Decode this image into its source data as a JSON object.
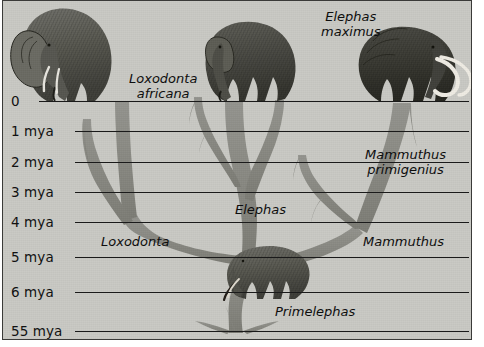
{
  "figure": {
    "kind": "phylogenetic-tree",
    "background_color": "#c9c9c4",
    "ink_color": "#1a1a1a",
    "branch_color": "#8a8a85"
  },
  "axis": {
    "orientation": "vertical-time",
    "unit": "mya",
    "ticks": [
      {
        "label": "0",
        "y": 100
      },
      {
        "label": "1 mya",
        "y": 130
      },
      {
        "label": "2 mya",
        "y": 161
      },
      {
        "label": "3 mya",
        "y": 191
      },
      {
        "label": "4 mya",
        "y": 221
      },
      {
        "label": "5 mya",
        "y": 256
      },
      {
        "label": "6 mya",
        "y": 291
      },
      {
        "label": "55 mya",
        "y": 330
      }
    ]
  },
  "taxa": [
    {
      "id": "loxodonta-africana",
      "label": "Loxodonta\nafricana",
      "rank": "species",
      "x": 126,
      "y": 70,
      "align": "left"
    },
    {
      "id": "elephas-maximus",
      "label": "Elephas\nmaximus",
      "rank": "species",
      "x": 318,
      "y": 8,
      "align": "left"
    },
    {
      "id": "mammuthus-primigenius",
      "label": "Mammuthus\nprimigenius",
      "rank": "species",
      "x": 362,
      "y": 146,
      "align": "left"
    },
    {
      "id": "loxodonta",
      "label": "Loxodonta",
      "rank": "genus",
      "x": 98,
      "y": 233,
      "align": "left"
    },
    {
      "id": "elephas",
      "label": "Elephas",
      "rank": "genus",
      "x": 232,
      "y": 201,
      "align": "left"
    },
    {
      "id": "mammuthus",
      "label": "Mammuthus",
      "rank": "genus",
      "x": 360,
      "y": 233,
      "align": "left"
    },
    {
      "id": "primelephas",
      "label": "Primelephas",
      "rank": "genus",
      "x": 272,
      "y": 303,
      "align": "left"
    }
  ],
  "illustrations": [
    {
      "id": "african-elephant-illustration",
      "taxon": "Loxodonta africana",
      "x": 16,
      "y": 2,
      "w": 112,
      "h": 100
    },
    {
      "id": "asian-elephant-illustration",
      "taxon": "Elephas maximus",
      "x": 198,
      "y": 10,
      "w": 118,
      "h": 92
    },
    {
      "id": "woolly-mammoth-illustration",
      "taxon": "Mammuthus primigenius",
      "x": 352,
      "y": 28,
      "w": 126,
      "h": 74
    },
    {
      "id": "primelephas-illustration",
      "taxon": "Primelephas",
      "x": 222,
      "y": 238,
      "w": 100,
      "h": 62
    }
  ]
}
